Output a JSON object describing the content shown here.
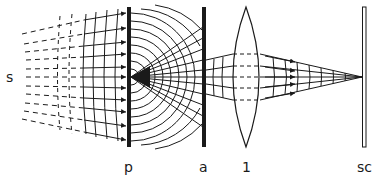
{
  "diagram": {
    "type": "optics-wavefront-diagram",
    "colors": {
      "ink": "#1a1a1a",
      "background": "#ffffff"
    },
    "labels": {
      "source": "s",
      "plate": "p",
      "aperture": "a",
      "lens": "1",
      "screen": "sc"
    },
    "elements": [
      {
        "id": "source",
        "label": "s",
        "description": "distant source emitting plane waves (dashed rays)"
      },
      {
        "id": "plate",
        "label": "p",
        "description": "opaque plate with pinhole; spherical waves diverge from it"
      },
      {
        "id": "aperture",
        "label": "a",
        "description": "aperture stop limiting the diverging cone"
      },
      {
        "id": "lens",
        "label": "1",
        "description": "converging biconvex lens"
      },
      {
        "id": "screen",
        "label": "sc",
        "description": "screen at focal point"
      }
    ]
  }
}
